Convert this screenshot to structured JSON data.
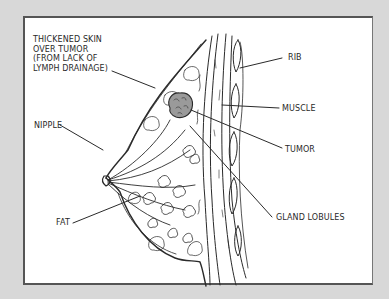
{
  "diagram": {
    "type": "anatomical-illustration",
    "colors": {
      "background": "#d8d8d8",
      "panel": "#ffffff",
      "ink": "#2a2a2a",
      "frame": "#555555"
    },
    "labels": {
      "thickened_skin": "THICKENED SKIN\nOVER TUMOR\n(FROM LACK OF\nLYMPH DRAINAGE)",
      "nipple": "NIPPLE",
      "fat": "FAT",
      "rib": "RIB",
      "muscle": "MUSCLE",
      "tumor": "TUMOR",
      "gland_lobules": "GLAND LOBULES"
    }
  }
}
